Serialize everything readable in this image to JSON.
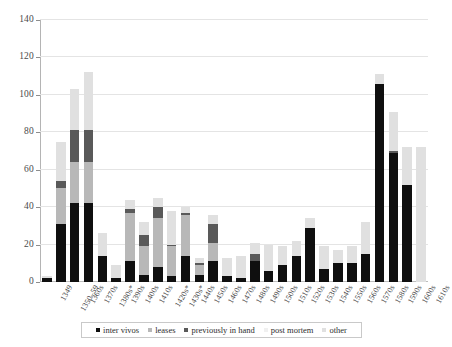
{
  "chart_data": {
    "type": "bar",
    "subtype": "stacked",
    "title": "",
    "subtitle": "",
    "xlabel": "",
    "ylabel": "",
    "ylim": [
      0,
      140
    ],
    "ytick_step": 20,
    "yticks": [
      0,
      20,
      40,
      60,
      80,
      100,
      120,
      140
    ],
    "grid": true,
    "legend_position": "bottom",
    "categories": [
      "1349",
      "1350–59",
      "1360s",
      "1370s",
      "1380s*",
      "1390s",
      "1400s",
      "1410s",
      "1420s*",
      "1430s*",
      "1440s",
      "1450s",
      "1460s",
      "1470s",
      "1480s",
      "1490s",
      "1500s",
      "1510s",
      "1520s",
      "1530s",
      "1540s",
      "1550s",
      "1560s",
      "1570s",
      "1580s",
      "1590s",
      "1600s",
      "1610s"
    ],
    "series": [
      {
        "name": "inter vivos",
        "color": "#0f0f0f",
        "values": [
          2,
          31,
          42,
          42,
          14,
          2,
          11,
          4,
          8,
          3,
          14,
          4,
          11,
          3,
          2,
          11,
          6,
          9,
          14,
          29,
          7,
          10,
          10,
          15,
          106,
          69,
          52,
          0
        ]
      },
      {
        "name": "leases",
        "color": "#b8b8b8",
        "values": [
          0,
          19,
          22,
          22,
          0,
          0,
          26,
          15,
          26,
          16,
          22,
          5,
          10,
          0,
          0,
          0,
          0,
          0,
          0,
          0,
          0,
          0,
          0,
          0,
          0,
          0,
          0,
          0
        ]
      },
      {
        "name": "previously in hand",
        "color": "#595959",
        "values": [
          0,
          4,
          17,
          17,
          0,
          0,
          2,
          6,
          6,
          1,
          1,
          1,
          10,
          0,
          0,
          4,
          0,
          0,
          0,
          0,
          0,
          0,
          0,
          0,
          0,
          1,
          0,
          0
        ]
      },
      {
        "name": "post mortem",
        "color": "#f0f0f0",
        "values": [
          0,
          0,
          0,
          0,
          0,
          0,
          0,
          0,
          0,
          0,
          0,
          0,
          0,
          0,
          0,
          0,
          0,
          0,
          0,
          0,
          0,
          0,
          0,
          0,
          0,
          0,
          0,
          0
        ]
      },
      {
        "name": "other",
        "color": "#e0e0e0",
        "values": [
          1,
          21,
          22,
          31,
          12,
          7,
          5,
          7,
          5,
          18,
          3,
          3,
          5,
          10,
          12,
          6,
          14,
          10,
          8,
          5,
          12,
          7,
          9,
          17,
          5,
          21,
          20,
          72
        ]
      }
    ],
    "totals": [
      3,
      75,
      103,
      112,
      26,
      9,
      44,
      32,
      45,
      38,
      40,
      13,
      36,
      13,
      14,
      21,
      20,
      19,
      22,
      34,
      19,
      17,
      19,
      32,
      111,
      91,
      72,
      72
    ]
  },
  "legend": {
    "items": [
      {
        "label": "inter vivos",
        "color": "#0f0f0f"
      },
      {
        "label": "leases",
        "color": "#b8b8b8"
      },
      {
        "label": "previously in hand",
        "color": "#595959"
      },
      {
        "label": "post mortem",
        "color": "#f0f0f0"
      },
      {
        "label": "other",
        "color": "#e0e0e0"
      }
    ]
  }
}
